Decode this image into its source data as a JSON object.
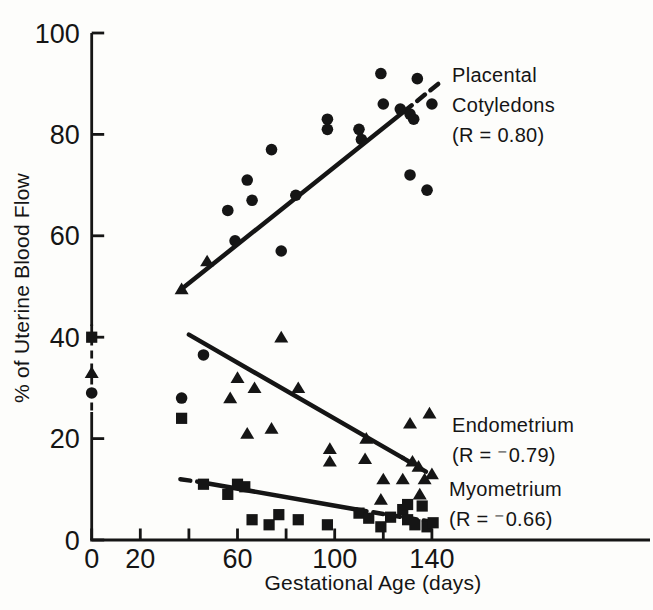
{
  "figure": {
    "background": "#fdfdfb",
    "ink": "#151515"
  },
  "chart_data": {
    "type": "scatter",
    "title": "",
    "xlabel": "Gestational Age (days)",
    "ylabel": "% of Uterine Blood Flow",
    "xlim": [
      0,
      185
    ],
    "ylim": [
      0,
      100
    ],
    "grid": false,
    "x_ticks": [
      0,
      20,
      40,
      60,
      80,
      100,
      120,
      140
    ],
    "x_tick_labels": [
      "0",
      "20",
      "",
      "60",
      "",
      "100",
      "",
      "140"
    ],
    "y_ticks": [
      0,
      20,
      40,
      60,
      80,
      100
    ],
    "y_tick_labels": [
      "0",
      "20",
      "40",
      "60",
      "80",
      "100"
    ],
    "series": [
      {
        "name": "Placental Cotyledons",
        "label": "Placental\nCotyledons\n(R = 0.80)",
        "r_value": "0.80",
        "marker": "circle",
        "points": [
          [
            0,
            29
          ],
          [
            37,
            28
          ],
          [
            46,
            36.5
          ],
          [
            56,
            65
          ],
          [
            59,
            59
          ],
          [
            64,
            71
          ],
          [
            66,
            67
          ],
          [
            74,
            77
          ],
          [
            78,
            57
          ],
          [
            84,
            68
          ],
          [
            97,
            83
          ],
          [
            97,
            81
          ],
          [
            110,
            81
          ],
          [
            111,
            79
          ],
          [
            119,
            92
          ],
          [
            120,
            86
          ],
          [
            127,
            85
          ],
          [
            131,
            84
          ],
          [
            132.5,
            83
          ],
          [
            134,
            91
          ],
          [
            140,
            86
          ],
          [
            131,
            72
          ],
          [
            138,
            69
          ]
        ],
        "trend": [
          {
            "from": [
              37,
              49.5
            ],
            "to": [
              128.5,
              84.5
            ],
            "style": "solid"
          },
          {
            "from": [
              128.5,
              84.5
            ],
            "to": [
              144,
              90.5
            ],
            "style": "dashed"
          }
        ]
      },
      {
        "name": "Endometrium",
        "label": "Endometrium\n(R = ⁻0.79)",
        "r_value": "⁻0.79",
        "marker": "triangle",
        "points": [
          [
            0,
            33
          ],
          [
            37,
            49.5
          ],
          [
            47.5,
            55
          ],
          [
            57,
            28
          ],
          [
            60,
            32
          ],
          [
            64,
            21
          ],
          [
            67,
            30
          ],
          [
            74,
            22
          ],
          [
            78,
            40
          ],
          [
            85,
            30
          ],
          [
            98,
            18
          ],
          [
            98,
            15.5
          ],
          [
            112.5,
            16
          ],
          [
            113,
            20
          ],
          [
            119,
            8
          ],
          [
            120,
            12
          ],
          [
            128,
            12
          ],
          [
            131,
            23
          ],
          [
            132,
            15.5
          ],
          [
            134.5,
            14.5
          ],
          [
            135,
            9
          ],
          [
            137,
            12
          ],
          [
            139,
            25
          ],
          [
            140,
            13
          ]
        ],
        "trend": [
          {
            "from": [
              40,
              40.5
            ],
            "to": [
              128,
              16.2
            ],
            "style": "solid"
          },
          {
            "from": [
              128,
              16.2
            ],
            "to": [
              138.5,
              13.2
            ],
            "style": "dashed"
          }
        ]
      },
      {
        "name": "Myometrium",
        "label": "Myometrium\n(R = ⁻0.66)",
        "r_value": "⁻0.66",
        "marker": "square",
        "points": [
          [
            0,
            40
          ],
          [
            37,
            24
          ],
          [
            46,
            11
          ],
          [
            56,
            9
          ],
          [
            60,
            11
          ],
          [
            63,
            10.5
          ],
          [
            66,
            4
          ],
          [
            73,
            3
          ],
          [
            77,
            5
          ],
          [
            85,
            4
          ],
          [
            97,
            3
          ],
          [
            110,
            5.3
          ],
          [
            114,
            4.3
          ],
          [
            119,
            2.6
          ],
          [
            123,
            4.5
          ],
          [
            128,
            6
          ],
          [
            130,
            7
          ],
          [
            136,
            6.7
          ],
          [
            130,
            4
          ],
          [
            133,
            3
          ],
          [
            138,
            2.6
          ],
          [
            140.5,
            3.4
          ]
        ],
        "trend": [
          {
            "from": [
              36.5,
              12
            ],
            "to": [
              45,
              11.4
            ],
            "style": "dashed"
          },
          {
            "from": [
              45,
              11.4
            ],
            "to": [
              109,
              6
            ],
            "style": "solid"
          },
          {
            "from": [
              109,
              6
            ],
            "to": [
              141,
              3.5
            ],
            "style": "dashed"
          }
        ]
      }
    ],
    "annotations": [
      {
        "type": "dashed_vertical",
        "x": 0,
        "y_from": 42.5,
        "y_to": 25.5
      }
    ]
  }
}
